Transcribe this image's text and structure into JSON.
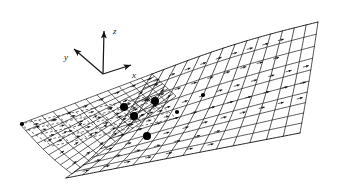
{
  "figure": {
    "background_color": "#ffffff",
    "line_color": "#1a1a1a",
    "marker_color": "#000000",
    "dashed_color": "#3a3a3a",
    "width": 346,
    "height": 189
  },
  "axes_triad": {
    "name": "coordinate-axes",
    "origin": {
      "x": 103,
      "y": 74
    },
    "axes": [
      {
        "id": "z",
        "label": "z",
        "tip": {
          "x": 104,
          "y": 31
        },
        "label_pos": {
          "x": 113,
          "y": 34
        }
      },
      {
        "id": "y",
        "label": "y",
        "tip": {
          "x": 74,
          "y": 49
        },
        "label_pos": {
          "x": 64,
          "y": 60
        }
      },
      {
        "id": "x",
        "label": "x",
        "tip": {
          "x": 131,
          "y": 65
        },
        "label_pos": {
          "x": 132,
          "y": 78
        }
      }
    ]
  },
  "mesh": {
    "name": "panel-mesh",
    "description": "Quadrilateral panel lattice over a cambered swept surface with trailing wake sheet",
    "surfaces": [
      {
        "id": "upper-surface",
        "style": "solid",
        "panels_chordwise": 10,
        "panels_spanwise": 6
      },
      {
        "id": "wake-sheet",
        "style": "solid",
        "panels_chordwise": 9,
        "panels_spanwise": 4
      },
      {
        "id": "lower-sheet",
        "style": "dashed",
        "panels_chordwise": 7,
        "panels_spanwise": 4
      }
    ],
    "corners": {
      "root_leading": {
        "x": 152,
        "y": 74
      },
      "tip_leading": {
        "x": 318,
        "y": 22
      },
      "tip_trailing": {
        "x": 300,
        "y": 133
      },
      "root_trailing": {
        "x": 66,
        "y": 178
      },
      "far_left": {
        "x": 20,
        "y": 124
      }
    }
  },
  "control_points": {
    "name": "highlighted-control-points",
    "radius": 4,
    "points": [
      {
        "id": "cp-1",
        "x": 155,
        "y": 101
      },
      {
        "id": "cp-2",
        "x": 134,
        "y": 116
      },
      {
        "id": "cp-3",
        "x": 147,
        "y": 136
      },
      {
        "id": "cp-4",
        "x": 124,
        "y": 107
      }
    ],
    "small_points": [
      {
        "id": "sp-0",
        "x": 22,
        "y": 124
      },
      {
        "id": "sp-1",
        "x": 123,
        "y": 106
      },
      {
        "id": "sp-2",
        "x": 177,
        "y": 112
      },
      {
        "id": "sp-3",
        "x": 203,
        "y": 95
      }
    ]
  },
  "vectors": {
    "name": "velocity-vectors",
    "description": "Small arrow glyphs drawn at each panel centroid indicating local flow direction",
    "count": 96,
    "glyph": "arrow-right"
  },
  "legend": {
    "visible": false,
    "items": []
  }
}
